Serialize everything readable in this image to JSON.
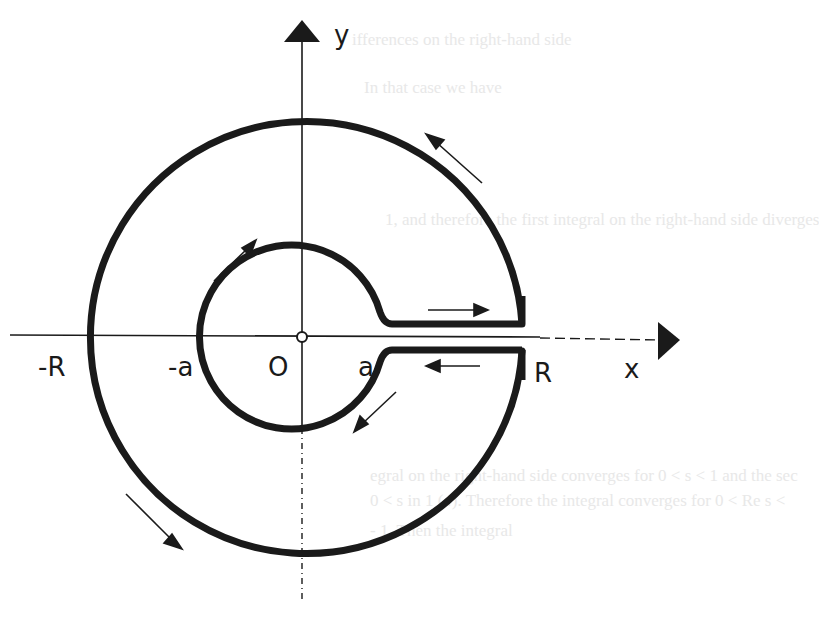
{
  "diagram": {
    "axes": {
      "x_label": "x",
      "y_label": "y"
    },
    "labels": {
      "neg_R": "-R",
      "neg_a": "-a",
      "origin": "O",
      "a": "a",
      "R": "R"
    },
    "contour": {
      "outer_radius_label": "R",
      "inner_radius_label": "a",
      "orientation": "counterclockwise on outer circle, clockwise on inner circle",
      "slot": "along positive real axis from a to R"
    },
    "colors": {
      "ink": "#1a1a1a",
      "background": "#ffffff",
      "bleed_text": "#e8e8e8"
    }
  },
  "background_bleed_text": {
    "line1": "ifferences on the right-hand side",
    "line2": "In that case we have",
    "line3": "1, and therefore the first integral on the right-hand side diverges",
    "line4": "egral on the right-hand side converges for 0 < s < 1 and the sec",
    "line5": "0 < s in 1 (4). Therefore the integral converges for 0 < Re s <",
    "line6": "- 1. Then the integral"
  }
}
